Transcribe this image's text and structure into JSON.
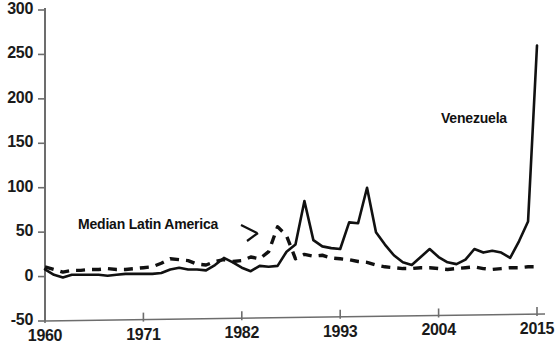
{
  "chart_data": {
    "type": "line",
    "title": "",
    "xlabel": "",
    "ylabel": "",
    "xlim": [
      1960,
      2015
    ],
    "ylim": [
      -50,
      300
    ],
    "ytick_labels": [
      "300",
      "250",
      "200",
      "150",
      "100",
      "50",
      "0",
      "-50"
    ],
    "ytick_values": [
      300,
      250,
      200,
      150,
      100,
      50,
      0,
      -50
    ],
    "xtick_labels": [
      "1960",
      "1971",
      "1982",
      "1993",
      "2004",
      "2015"
    ],
    "xtick_values": [
      1960,
      1971,
      1982,
      1993,
      2004,
      2015
    ],
    "grid": false,
    "legend_position": "inline-annotations",
    "series": [
      {
        "name": "Venezuela",
        "style": "solid",
        "color": "#111111",
        "x": [
          1960,
          1961,
          1962,
          1963,
          1964,
          1965,
          1966,
          1967,
          1968,
          1969,
          1970,
          1971,
          1972,
          1973,
          1974,
          1975,
          1976,
          1977,
          1978,
          1979,
          1980,
          1981,
          1982,
          1983,
          1984,
          1985,
          1986,
          1987,
          1988,
          1989,
          1990,
          1991,
          1992,
          1993,
          1994,
          1995,
          1996,
          1997,
          1998,
          1999,
          2000,
          2001,
          2002,
          2003,
          2004,
          2005,
          2006,
          2007,
          2008,
          2009,
          2010,
          2011,
          2012,
          2013,
          2014,
          2015
        ],
        "values": [
          8,
          2,
          -1,
          2,
          2,
          2,
          2,
          1,
          2,
          3,
          3,
          3,
          3,
          4,
          8,
          10,
          8,
          8,
          7,
          13,
          21,
          16,
          10,
          6,
          12,
          11,
          12,
          28,
          36,
          85,
          41,
          34,
          32,
          31,
          61,
          60,
          100,
          50,
          36,
          24,
          16,
          13,
          22,
          31,
          22,
          16,
          14,
          19,
          31,
          27,
          29,
          27,
          21,
          40,
          62,
          260
        ]
      },
      {
        "name": "Median Latin America",
        "style": "dashed",
        "color": "#111111",
        "x": [
          1960,
          1961,
          1962,
          1963,
          1964,
          1965,
          1966,
          1967,
          1968,
          1969,
          1970,
          1971,
          1972,
          1973,
          1974,
          1975,
          1976,
          1977,
          1978,
          1979,
          1980,
          1981,
          1982,
          1983,
          1984,
          1985,
          1986,
          1987,
          1988,
          1989,
          1990,
          1991,
          1992,
          1993,
          1994,
          1995,
          1996,
          1997,
          1998,
          1999,
          2000,
          2001,
          2002,
          2003,
          2004,
          2005,
          2006,
          2007,
          2008,
          2009,
          2010,
          2011,
          2012,
          2013,
          2014,
          2015
        ],
        "values": [
          11,
          8,
          5,
          7,
          7,
          8,
          8,
          9,
          8,
          8,
          9,
          10,
          11,
          15,
          20,
          19,
          18,
          14,
          13,
          17,
          19,
          17,
          18,
          22,
          20,
          28,
          56,
          46,
          20,
          25,
          23,
          24,
          21,
          20,
          19,
          17,
          16,
          13,
          11,
          10,
          9,
          9,
          10,
          10,
          9,
          8,
          9,
          10,
          11,
          9,
          8,
          9,
          10,
          10,
          11,
          11
        ]
      }
    ],
    "annotations": [
      {
        "text": "Median Latin America",
        "anchor_year": 1983,
        "anchor_value": 30
      },
      {
        "text": "Venezuela",
        "anchor_year": 2011,
        "anchor_value": 195
      }
    ]
  },
  "footer_note": ""
}
